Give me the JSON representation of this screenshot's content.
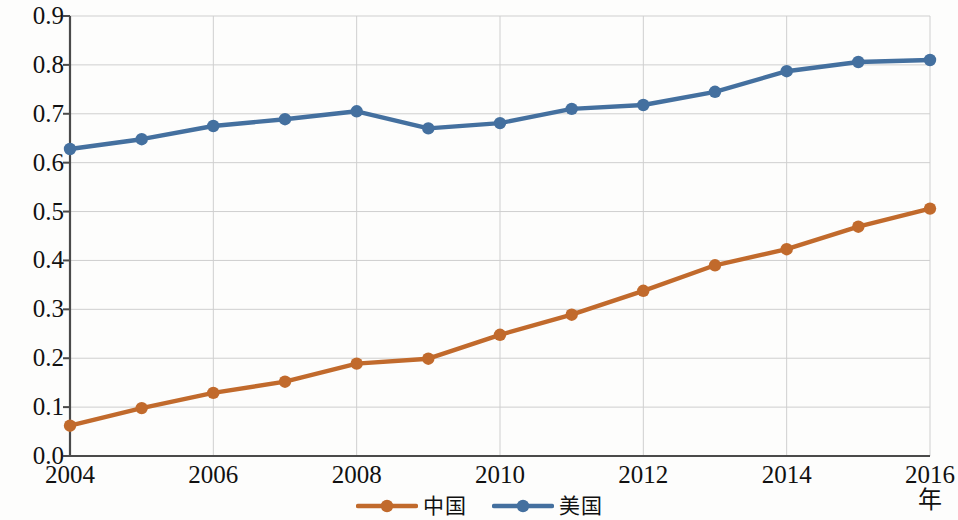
{
  "chart_data": {
    "type": "line",
    "title": "",
    "xlabel": "年",
    "ylabel": "科技竞争力",
    "x": [
      2004,
      2005,
      2006,
      2007,
      2008,
      2009,
      2010,
      2011,
      2012,
      2013,
      2014,
      2015,
      2016
    ],
    "xlim": [
      2004,
      2016
    ],
    "ylim": [
      0.0,
      0.9
    ],
    "x_tick_labels": [
      "2004",
      "2006",
      "2008",
      "2010",
      "2012",
      "2014",
      "2016"
    ],
    "x_tick_values": [
      2004,
      2006,
      2008,
      2010,
      2012,
      2014,
      2016
    ],
    "y_tick_labels": [
      "0.0",
      "0.1",
      "0.2",
      "0.3",
      "0.4",
      "0.5",
      "0.6",
      "0.7",
      "0.8",
      "0.9"
    ],
    "y_tick_values": [
      0.0,
      0.1,
      0.2,
      0.3,
      0.4,
      0.5,
      0.6,
      0.7,
      0.8,
      0.9
    ],
    "grid": true,
    "grid_color": "#cfcfcf",
    "legend_position": "bottom-center",
    "series": [
      {
        "name": "中国",
        "color": "#c16a2c",
        "marker": "circle",
        "values": [
          0.062,
          0.098,
          0.129,
          0.152,
          0.189,
          0.199,
          0.248,
          0.289,
          0.338,
          0.39,
          0.423,
          0.469,
          0.506
        ]
      },
      {
        "name": "美国",
        "color": "#44709f",
        "marker": "circle",
        "values": [
          0.628,
          0.648,
          0.675,
          0.689,
          0.705,
          0.67,
          0.681,
          0.71,
          0.718,
          0.745,
          0.787,
          0.806,
          0.81
        ]
      }
    ]
  },
  "axes": {
    "y_title": "科技竞争力",
    "x_title": "年"
  },
  "legend": {
    "items": [
      {
        "label": "中国",
        "color": "#c16a2c"
      },
      {
        "label": "美国",
        "color": "#44709f"
      }
    ]
  }
}
